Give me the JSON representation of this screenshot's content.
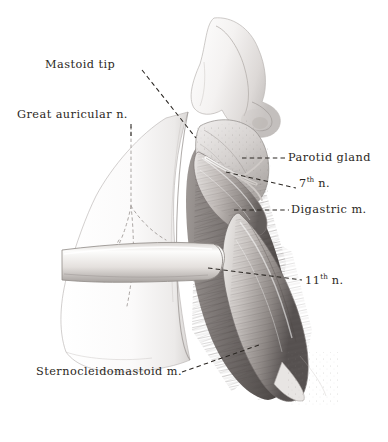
{
  "figure": {
    "medium": "graphite and wash anatomical illustration",
    "background_color": "#ffffff",
    "ink_color": "#2b2723",
    "leader_style": "dashed"
  },
  "labels": [
    {
      "id": "mastoid-tip",
      "text": "Mastoid tip"
    },
    {
      "id": "great-auricular",
      "text": "Great auricular n."
    },
    {
      "id": "parotid-gland",
      "text": "Parotid gland"
    },
    {
      "id": "seventh-nerve",
      "text": "7",
      "sup": "th",
      "tail": " n."
    },
    {
      "id": "digastric-muscle",
      "text": "Digastric m."
    },
    {
      "id": "eleventh-nerve",
      "text": "11",
      "sup": "th",
      "tail": " n."
    },
    {
      "id": "sternocleidomastoid",
      "text": "Sternocleidomastoid m."
    }
  ],
  "structures": [
    {
      "name": "auricle-earlobe",
      "region": "top"
    },
    {
      "name": "parotid-gland",
      "region": "upper-right"
    },
    {
      "name": "digastric-muscle",
      "region": "middle-right"
    },
    {
      "name": "facial-nerve",
      "region": "middle"
    },
    {
      "name": "accessory-nerve",
      "region": "lower-middle"
    },
    {
      "name": "sternocleidomastoid",
      "region": "lower-right"
    },
    {
      "name": "skin-flap",
      "region": "left"
    },
    {
      "name": "retractor-band",
      "region": "center-left"
    }
  ]
}
